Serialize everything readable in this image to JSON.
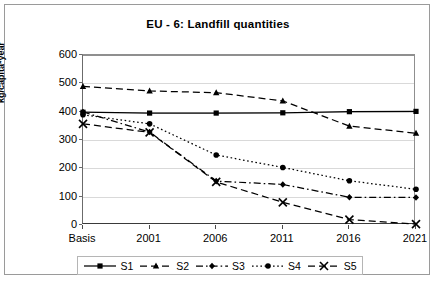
{
  "chart_data": {
    "type": "line",
    "title": "EU - 6: Landfill quantities",
    "xlabel": "",
    "ylabel": "kg/capita*year",
    "categories": [
      "Basis",
      "2001",
      "2006",
      "2011",
      "2016",
      "2021"
    ],
    "ylim": [
      0,
      600
    ],
    "ytick_values": [
      0,
      100,
      200,
      300,
      400,
      500,
      600
    ],
    "ytick_labels": [
      "0",
      "100",
      "200",
      "300",
      "400",
      "500",
      "600"
    ],
    "grid": true,
    "legend_position": "bottom",
    "series": [
      {
        "name": "S1",
        "values": [
          398,
          395,
          395,
          396,
          400,
          401
        ],
        "marker": "square",
        "line_style": "solid",
        "color": "#000000"
      },
      {
        "name": "S2",
        "values": [
          489,
          473,
          467,
          438,
          349,
          324
        ],
        "marker": "triangle",
        "line_style": "dashed",
        "color": "#000000"
      },
      {
        "name": "S3",
        "values": [
          399,
          328,
          155,
          143,
          98,
          97
        ],
        "marker": "diamond",
        "line_style": "dash-dot",
        "color": "#000000"
      },
      {
        "name": "S4",
        "values": [
          389,
          357,
          247,
          203,
          156,
          126
        ],
        "marker": "circle",
        "line_style": "dotted",
        "color": "#000000"
      },
      {
        "name": "S5",
        "values": [
          357,
          327,
          152,
          80,
          19,
          3
        ],
        "marker": "cross",
        "line_style": "dashed",
        "color": "#000000"
      }
    ]
  },
  "legend": {
    "entries": [
      {
        "label": "S1"
      },
      {
        "label": "S2"
      },
      {
        "label": "S3"
      },
      {
        "label": "S4"
      },
      {
        "label": "S5"
      }
    ]
  }
}
